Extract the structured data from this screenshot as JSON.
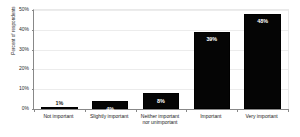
{
  "chart_data": {
    "type": "bar",
    "title": "",
    "subtitle": "",
    "xlabel": "",
    "ylabel": "Percent of respondents",
    "categories": [
      "Not important",
      "Slightly important",
      "Neither important nor unimportant",
      "Important",
      "Very important"
    ],
    "category_lines": [
      [
        "Not important"
      ],
      [
        "Slightly important"
      ],
      [
        "Neither important",
        "nor unimportant"
      ],
      [
        "Important"
      ],
      [
        "Very important"
      ]
    ],
    "values": [
      1,
      4,
      8,
      39,
      48
    ],
    "data_labels": [
      "1%",
      "4%",
      "8%",
      "39%",
      "48%"
    ],
    "label_placement": [
      "outside",
      "inside",
      "inside",
      "inside",
      "inside"
    ],
    "ylim": [
      0,
      50
    ],
    "y_ticks": [
      0,
      10,
      20,
      30,
      40,
      50
    ],
    "y_tick_labels": [
      "0%",
      "10%",
      "20%",
      "30%",
      "40%",
      "50%"
    ],
    "grid": "horizontal",
    "legend": "none",
    "series": [
      {
        "name": "Percent of respondents",
        "values": [
          1,
          4,
          8,
          39,
          48
        ]
      }
    ]
  },
  "colors": {
    "bar_fill": "#050505",
    "bar_border": "#000000",
    "gridline": "#ececec",
    "axis": "#888888",
    "background": "#ffffff",
    "label_inside": "#ffffff",
    "label_outside": "#1a1a1a"
  }
}
